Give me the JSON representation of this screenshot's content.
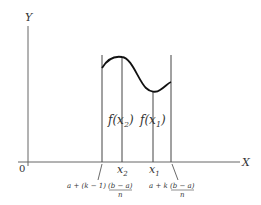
{
  "axes": {
    "y_label": "Y",
    "x_label": "X",
    "origin_label": "0"
  },
  "function_labels": {
    "f_x2": "f(x",
    "f_x2_sub": "2",
    "f_x1": "f(x",
    "f_x1_sub": "1",
    "close": ")"
  },
  "tick_labels": {
    "x2": "x",
    "x2_sub": "2",
    "x1": "x",
    "x1_sub": "1"
  },
  "interval_labels": {
    "left_prefix": "a + (k − 1)",
    "left_numer": "(b − a)",
    "left_denom": "n",
    "right_prefix": "a + k",
    "right_numer": "(b − a)",
    "right_denom": "n"
  },
  "colors": {
    "axis": "#555555",
    "curve": "#111111",
    "text": "#333333"
  }
}
